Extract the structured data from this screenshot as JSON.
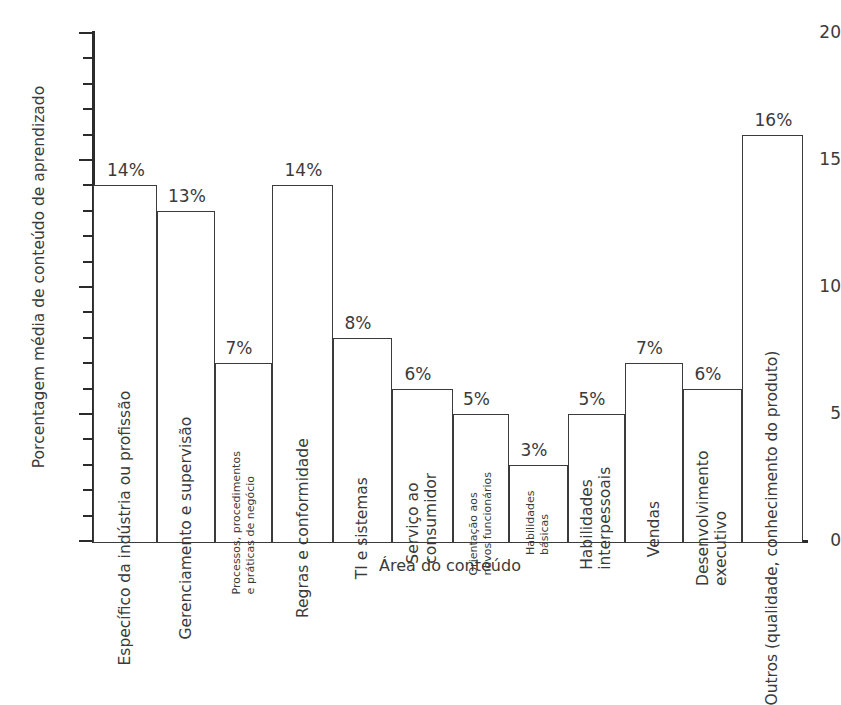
{
  "chart_data": {
    "type": "bar",
    "title": "",
    "xlabel": "Área do conteúdo",
    "ylabel": "Porcentagem média de conteúdo de aprendizado",
    "ylim": [
      0,
      20
    ],
    "ytick_labels": [
      "0",
      "5",
      "10",
      "15",
      "20"
    ],
    "ytick_values": [
      0,
      5,
      10,
      15,
      20
    ],
    "minor_tick_step": 1,
    "grid": false,
    "legend": "none",
    "unit": "%",
    "categories": [
      "Específico da indústria ou profissão",
      "Gerenciamento e supervisão",
      "Processos, procedimentos e práticas de negócio",
      "Regras e conformidade",
      "TI e sistemas",
      "Serviço ao consumidor",
      "Orientação aos novos funcionários",
      "Habilidades básicas",
      "Habilidades interpessoais",
      "Vendas",
      "Desenvolvimento executivo",
      "Outros (qualidade, conhecimento do produto)"
    ],
    "values": [
      14,
      13,
      7,
      14,
      8,
      6,
      5,
      3,
      5,
      7,
      6,
      16
    ],
    "data_labels": [
      "14%",
      "13%",
      "7%",
      "14%",
      "8%",
      "6%",
      "5%",
      "3%",
      "5%",
      "7%",
      "6%",
      "16%"
    ],
    "bars": [
      {
        "label": "Específico da indústria ou profissão",
        "label_lines": [
          "Específico da indústria ou profissão"
        ],
        "value": 14,
        "data_label": "14%",
        "label_size": "normal"
      },
      {
        "label": "Gerenciamento e supervisão",
        "label_lines": [
          "Gerenciamento e supervisão"
        ],
        "value": 13,
        "data_label": "13%",
        "label_size": "normal"
      },
      {
        "label": "Processos, procedimentos e práticas de negócio",
        "label_lines": [
          "Processos, procedimentos",
          "e práticas de negócio"
        ],
        "value": 7,
        "data_label": "7%",
        "label_size": "small"
      },
      {
        "label": "Regras e conformidade",
        "label_lines": [
          "Regras e conformidade"
        ],
        "value": 14,
        "data_label": "14%",
        "label_size": "normal"
      },
      {
        "label": "TI e sistemas",
        "label_lines": [
          "TI e sistemas"
        ],
        "value": 8,
        "data_label": "8%",
        "label_size": "normal"
      },
      {
        "label": "Serviço ao consumidor",
        "label_lines": [
          "Serviço ao",
          "consumidor"
        ],
        "value": 6,
        "data_label": "6%",
        "label_size": "normal"
      },
      {
        "label": "Orientação aos novos funcionários",
        "label_lines": [
          "Orientação aos",
          "novos funcionários"
        ],
        "value": 5,
        "data_label": "5%",
        "label_size": "small"
      },
      {
        "label": "Habilidades básicas",
        "label_lines": [
          "Habilidades",
          "básicas"
        ],
        "value": 3,
        "data_label": "3%",
        "label_size": "small"
      },
      {
        "label": "Habilidades interpessoais",
        "label_lines": [
          "Habilidades",
          "interpessoais"
        ],
        "value": 5,
        "data_label": "5%",
        "label_size": "normal"
      },
      {
        "label": "Vendas",
        "label_lines": [
          "Vendas"
        ],
        "value": 7,
        "data_label": "7%",
        "label_size": "normal"
      },
      {
        "label": "Desenvolvimento executivo",
        "label_lines": [
          "Desenvolvimento",
          "executivo"
        ],
        "value": 6,
        "data_label": "6%",
        "label_size": "normal"
      },
      {
        "label": "Outros (qualidade, conhecimento do produto)",
        "label_lines": [
          "Outros (qualidade, conhecimento do produto)"
        ],
        "value": 16,
        "data_label": "16%",
        "label_size": "normal"
      }
    ],
    "colors": {
      "bar_fill": "#ffffff",
      "bar_stroke": "#3b3b3b",
      "axis": "#2b2b2b",
      "text": "#3a3a3a",
      "background": "#ffffff"
    }
  }
}
